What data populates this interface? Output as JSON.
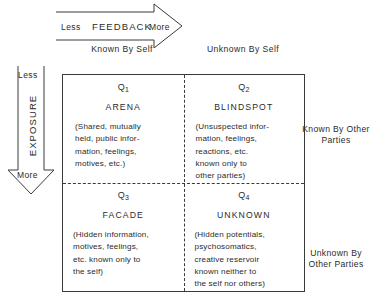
{
  "diagram": {
    "ink_color": "#2b2b2b",
    "background_color": "#ffffff"
  },
  "feedback_axis": {
    "name": "FEEDBACK",
    "low_label": "Less",
    "high_label": "More",
    "direction": "right",
    "arrow_icon": "right-arrow-icon"
  },
  "exposure_axis": {
    "name": "EXPOSURE",
    "low_label": "Less",
    "high_label": "More",
    "direction": "down",
    "arrow_icon": "down-arrow-icon"
  },
  "column_headers": [
    "Known\nBy\nSelf",
    "Unknown\nBy\nSelf"
  ],
  "row_labels": [
    "Known By\nOther Parties",
    "Unknown By\nOther Parties"
  ],
  "quadrants": [
    {
      "code": "Q",
      "index": "1",
      "title": "ARENA",
      "body": "(Shared, mutually\nheld, public infor-\nmation, feelings,\nmotives, etc.)"
    },
    {
      "code": "Q",
      "index": "2",
      "title": "BLINDSPOT",
      "body": "(Unsuspected infor-\nmation, feelings,\nreactions, etc.\nknown only to\nother parties)"
    },
    {
      "code": "Q",
      "index": "3",
      "title": "FACADE",
      "body": "(Hidden information,\nmotives, feelings,\netc. known only to\nthe self)"
    },
    {
      "code": "Q",
      "index": "4",
      "title": "UNKNOWN",
      "body": "(Hidden potentials,\npsychosomatics,\ncreative reservoir\nknown neither to\nthe self nor others)"
    }
  ]
}
